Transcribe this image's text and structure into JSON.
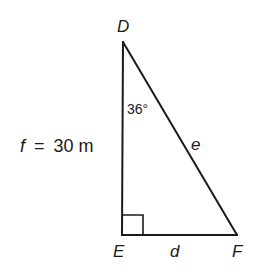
{
  "diagram": {
    "type": "right-triangle",
    "vertices": {
      "D": {
        "label": "D",
        "x": 123,
        "y": 42
      },
      "E": {
        "label": "E",
        "x": 122,
        "y": 235
      },
      "F": {
        "label": "F",
        "x": 237,
        "y": 235
      }
    },
    "sides": {
      "f": {
        "label": "f = 30 m",
        "name": "f",
        "value": "30 m",
        "between": [
          "D",
          "E"
        ]
      },
      "d": {
        "label": "d",
        "name": "d",
        "between": [
          "E",
          "F"
        ]
      },
      "e": {
        "label": "e",
        "name": "e",
        "between": [
          "D",
          "F"
        ]
      }
    },
    "angles": {
      "D": {
        "label": "36°",
        "value_degrees": 36
      },
      "E": {
        "label": "right angle",
        "value_degrees": 90
      }
    },
    "colors": {
      "stroke": "#1a1a1a",
      "background": "#ffffff"
    }
  }
}
